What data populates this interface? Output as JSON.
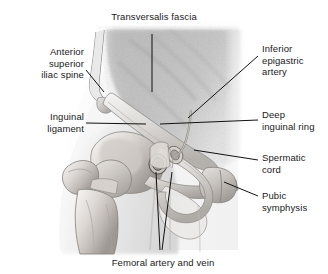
{
  "figure": {
    "type": "anatomical-illustration",
    "style": "grayscale medical line and wash drawing",
    "background_color": "#ffffff",
    "text_color": "#1a1a1a",
    "leader_line_color": "#111111"
  },
  "labels": [
    {
      "id": "transversalis-fascia",
      "text": "Transversalis fascia",
      "position": "top-center",
      "align": "center",
      "leader": "vertical line down to abdominal wall"
    },
    {
      "id": "anterior-superior-iliac-spine",
      "text": "Anterior\nsuperior\niliac spine",
      "position": "upper-left",
      "align": "right",
      "leader": "diagonal line to iliac crest prominence"
    },
    {
      "id": "inguinal-ligament",
      "text": "Inguinal\nligament",
      "position": "middle-left",
      "align": "right",
      "leader": "horizontal line to ligament band"
    },
    {
      "id": "inferior-epigastric-artery",
      "text": "Inferior\nepigastric\nartery",
      "position": "upper-right",
      "align": "left",
      "leader": "diagonal line to vessel on abdominal wall"
    },
    {
      "id": "deep-inguinal-ring",
      "text": "Deep\ninguinal ring",
      "position": "middle-right",
      "align": "left",
      "leader": "horizontal line to ring opening"
    },
    {
      "id": "spermatic-cord",
      "text": "Spermatic\ncord",
      "position": "lower-right",
      "align": "left",
      "leader": "horizontal line to cord structure"
    },
    {
      "id": "pubic-symphysis",
      "text": "Pubic\nsymphysis",
      "position": "bottom-right",
      "align": "left",
      "leader": "diagonal line to pubic bone junction"
    },
    {
      "id": "femoral-artery-and-vein",
      "text": "Femoral artery and vein",
      "position": "bottom-center",
      "align": "center",
      "leader": "two diagonal lines converging up to vessel cross-sections"
    }
  ],
  "structures": [
    "abdominal wall soft tissue mass",
    "iliac crest",
    "anterior superior iliac spine",
    "inguinal ligament",
    "femur head and neck",
    "greater trochanter",
    "femoral shaft",
    "pubic bone and symphysis",
    "spermatic cord",
    "deep inguinal ring",
    "inferior epigastric artery",
    "femoral artery and vein cross-section"
  ]
}
